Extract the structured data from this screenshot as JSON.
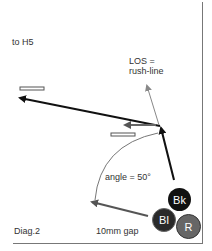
{
  "diagram": {
    "label_target": "to H5",
    "label_los_line1": "LOS =",
    "label_los_line2": "rush-line",
    "label_angle": "angle = 50°",
    "label_diagram": "Diag.2",
    "label_gap": "10mm gap",
    "balls": [
      {
        "label": "Bk",
        "color": "#111111"
      },
      {
        "label": "Bl",
        "color": "#2a2a2a"
      },
      {
        "label": "R",
        "color": "#666666"
      }
    ],
    "colors": {
      "primary_arrow": "#111111",
      "secondary_arrow": "#555555",
      "los_arrow": "#888888",
      "frame": "#777777"
    }
  }
}
